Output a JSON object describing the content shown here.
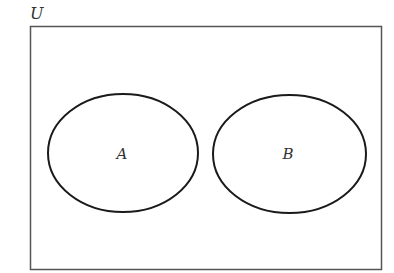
{
  "diagram": {
    "type": "venn",
    "universe": {
      "label": "U",
      "rect": {
        "x": 30.5,
        "y": 26.5,
        "width": 351,
        "height": 243
      }
    },
    "sets": [
      {
        "label": "A",
        "cx": 123,
        "cy": 153,
        "rx": 75,
        "ry": 59
      },
      {
        "label": "B",
        "cx": 289.5,
        "cy": 154,
        "rx": 76.5,
        "ry": 59
      }
    ],
    "relationship": "disjoint",
    "colors": {
      "frame": "#555555",
      "ellipse": "#1a1a1a",
      "text": "#333333",
      "background": "#ffffff"
    }
  }
}
